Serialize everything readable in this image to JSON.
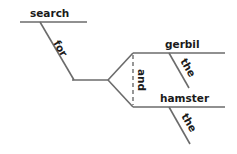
{
  "diagram": {
    "type": "sentence-diagram",
    "words": {
      "verb": "search",
      "preposition": "for",
      "conjunction": "and",
      "object_1": "gerbil",
      "object_1_article": "the",
      "object_2": "hamster",
      "object_2_article": "the"
    },
    "line_color": "#6b6b6b",
    "text_color": "#1a1a1a"
  }
}
